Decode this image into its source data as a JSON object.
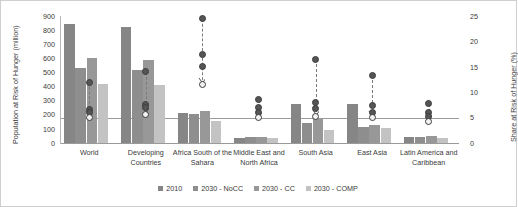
{
  "chart_data": {
    "type": "bar",
    "title": "",
    "xlabel": "",
    "ylabel": "Population at Risk of Hunger (million)",
    "ylabel_right": "Share at Risk of Hunger (%)",
    "ylim": [
      0,
      900
    ],
    "ylim_right": [
      0,
      25
    ],
    "yticks": [
      "900",
      "800",
      "700",
      "600",
      "500",
      "400",
      "300",
      "200",
      "100",
      "0"
    ],
    "yticks_right": [
      "25",
      "20",
      "15",
      "10",
      "5",
      "0"
    ],
    "grid": false,
    "legend_position": "bottom",
    "categories": [
      "World",
      "Developing Countries",
      "Africa South of the Sahara",
      "Middle East and North Africa",
      "South Asia",
      "East Asia",
      "Latin America and Caribbean"
    ],
    "series": [
      {
        "name": "2010",
        "color": "#868686",
        "values": [
          840,
          825,
          210,
          38,
          275,
          275,
          42
        ]
      },
      {
        "name": "2030 - NoCC",
        "color": "#8e8e8e",
        "values": [
          530,
          515,
          205,
          42,
          145,
          110,
          45
        ]
      },
      {
        "name": "2030 - CC",
        "color": "#989898",
        "values": [
          600,
          585,
          230,
          45,
          170,
          125,
          48
        ]
      },
      {
        "name": "2030 - COMP",
        "color": "#c3c3c3",
        "values": [
          420,
          410,
          155,
          35,
          95,
          105,
          35
        ]
      }
    ],
    "marker_series": [
      {
        "name": "2010",
        "axis": "right",
        "style": "dark",
        "values": [
          12.0,
          14.0,
          24.5,
          8.5,
          16.5,
          13.3,
          7.7
        ]
      },
      {
        "name": "2030 - NoCC",
        "axis": "right",
        "style": "dark",
        "values": [
          6.5,
          7.5,
          17.5,
          7.0,
          8.0,
          7.3,
          6.0
        ]
      },
      {
        "name": "2030 - CC",
        "axis": "right",
        "style": "dark",
        "values": [
          6.0,
          7.0,
          15.0,
          6.0,
          6.7,
          6.0,
          5.3
        ]
      },
      {
        "name": "2030 - COMP",
        "axis": "right",
        "style": "light",
        "values": [
          5.0,
          5.7,
          11.5,
          5.0,
          5.2,
          5.0,
          4.3
        ]
      }
    ]
  },
  "legend": {
    "items": [
      {
        "label": "2010",
        "color": "#868686"
      },
      {
        "label": "2030 - NoCC",
        "color": "#8e8e8e"
      },
      {
        "label": "2030 - CC",
        "color": "#989898"
      },
      {
        "label": "2030 - COMP",
        "color": "#c3c3c3"
      }
    ]
  }
}
